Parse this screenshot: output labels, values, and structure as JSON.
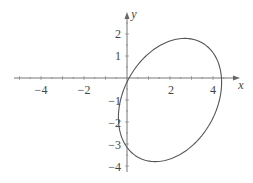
{
  "chart_data": {
    "type": "line",
    "title": "",
    "xlabel": "x",
    "ylabel": "y",
    "xlim": [
      -5.3,
      5
    ],
    "ylim": [
      -4.2,
      2.9
    ],
    "x_ticks": [
      -4,
      -2,
      2,
      4
    ],
    "y_ticks": [
      2,
      1,
      -1,
      -2,
      -3,
      -4
    ],
    "grid": false,
    "legend": null,
    "series": [
      {
        "name": "ellipse",
        "kind": "parametric",
        "x_expr": "2 + 2.4*cos(t)",
        "y_expr": "-1 + 2.8*sin(t + 0.29)",
        "t_range": [
          0,
          6.2832
        ],
        "center": [
          2,
          -1
        ],
        "x_intercepts": [
          0.3,
          4.4
        ],
        "y_intercepts": [
          -0.7,
          -3.0
        ],
        "top": [
          2.7,
          1.8
        ],
        "bottom": [
          1.3,
          -3.8
        ],
        "color": "#555555"
      }
    ]
  },
  "axes": {
    "x_label": "x",
    "y_label": "y",
    "x_tick_labels": [
      "−4",
      "−2",
      "2",
      "4"
    ],
    "y_tick_labels": [
      "2",
      "1",
      "−1",
      "−2",
      "−3",
      "−4"
    ]
  }
}
